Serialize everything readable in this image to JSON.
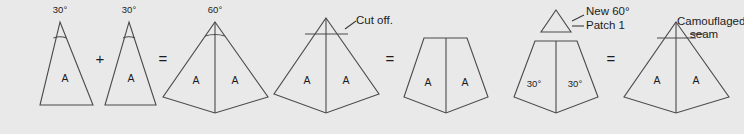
{
  "figure": {
    "background_color": "#e9e9e9",
    "line_color": "#4a4a4a",
    "text_color": "#1c1c1c"
  },
  "steps": [
    {
      "id": "gore-1",
      "name": "first-30-degree-gore",
      "angle_label": "30°",
      "piece_label": "A"
    },
    {
      "id": "operator-plus",
      "name": "plus-operator",
      "label": "+"
    },
    {
      "id": "gore-2",
      "name": "second-30-degree-gore",
      "angle_label": "30°",
      "piece_label": "A"
    },
    {
      "id": "operator-equals-1",
      "name": "equals-operator-1",
      "label": "="
    },
    {
      "id": "cone-60",
      "name": "joined-60-degree-cone",
      "angle_label": "60°",
      "piece_label_left": "A",
      "piece_label_right": "A"
    },
    {
      "id": "cone-cutoff",
      "name": "cone-with-cut-line",
      "note": "Cut off.",
      "piece_label_left": "A",
      "piece_label_right": "A"
    },
    {
      "id": "operator-equals-2",
      "name": "equals-operator-2",
      "label": "="
    },
    {
      "id": "truncated-cone",
      "name": "truncated-cone",
      "piece_label_left": "A",
      "piece_label_right": "A"
    },
    {
      "id": "truncated-with-patch",
      "name": "truncated-cone-with-new-patch",
      "note_line_1": "New 60°",
      "note_line_2": "Patch 1",
      "angle_label_left": "30°",
      "angle_label_right": "30°"
    },
    {
      "id": "operator-equals-3",
      "name": "equals-operator-3",
      "label": "="
    },
    {
      "id": "final-cone",
      "name": "final-cone-with-camouflaged-seam",
      "note_line_1": "Camouflaged",
      "note_line_2": "seam",
      "piece_label_left": "A",
      "piece_label_right": "A"
    }
  ]
}
